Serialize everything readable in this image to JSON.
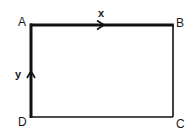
{
  "diagram": {
    "type": "rectangle-circuit",
    "vertices": {
      "A": {
        "label": "A",
        "x": 31,
        "y": 25
      },
      "B": {
        "label": "B",
        "x": 173,
        "y": 25
      },
      "C": {
        "label": "C",
        "x": 173,
        "y": 117
      },
      "D": {
        "label": "D",
        "x": 31,
        "y": 117
      }
    },
    "edges": [
      {
        "from": "A",
        "to": "B",
        "weight": "thick",
        "arrow": "right",
        "label": "x"
      },
      {
        "from": "B",
        "to": "C",
        "weight": "thin"
      },
      {
        "from": "C",
        "to": "D",
        "weight": "thin"
      },
      {
        "from": "D",
        "to": "A",
        "weight": "thick",
        "arrow": "up",
        "label": "y"
      }
    ],
    "labels": {
      "a": "A",
      "b": "B",
      "c": "C",
      "d": "D",
      "x": "x",
      "y": "y"
    },
    "colors": {
      "line": "#111111",
      "background": "#ffffff"
    }
  }
}
